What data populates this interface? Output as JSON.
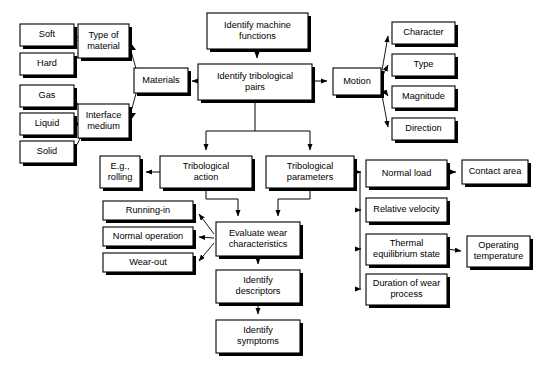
{
  "diagram": {
    "type": "flowchart",
    "background_color": "#ffffff",
    "box_fill_color": "#ffffff",
    "box_border_color": "#000000",
    "connector_color": "#000000",
    "nodes": [
      {
        "id": "soft",
        "label": "Soft",
        "x": 20,
        "y": 24,
        "w": 54,
        "h": 22
      },
      {
        "id": "hard",
        "label": "Hard",
        "x": 20,
        "y": 53,
        "w": 54,
        "h": 22
      },
      {
        "id": "gas",
        "label": "Gas",
        "x": 20,
        "y": 85,
        "w": 54,
        "h": 22
      },
      {
        "id": "liquid",
        "label": "Liquid",
        "x": 20,
        "y": 113,
        "w": 54,
        "h": 22
      },
      {
        "id": "solid",
        "label": "Solid",
        "x": 20,
        "y": 141,
        "w": 54,
        "h": 22
      },
      {
        "id": "type_material",
        "label": "Type of\nmaterial",
        "x": 78,
        "y": 24,
        "w": 51,
        "h": 34
      },
      {
        "id": "interface_med",
        "label": "Interface\nmedium",
        "x": 78,
        "y": 104,
        "w": 51,
        "h": 34
      },
      {
        "id": "materials",
        "label": "Materials",
        "x": 134,
        "y": 68,
        "w": 54,
        "h": 25
      },
      {
        "id": "machine_fn",
        "label": "Identify machine\nfunctions",
        "x": 207,
        "y": 13,
        "w": 101,
        "h": 36
      },
      {
        "id": "trib_pairs",
        "label": "Identify tribological\npairs",
        "x": 198,
        "y": 64,
        "w": 114,
        "h": 36
      },
      {
        "id": "motion",
        "label": "Motion",
        "x": 333,
        "y": 68,
        "w": 48,
        "h": 27
      },
      {
        "id": "character",
        "label": "Character",
        "x": 392,
        "y": 22,
        "w": 63,
        "h": 22
      },
      {
        "id": "mtype",
        "label": "Type",
        "x": 392,
        "y": 54,
        "w": 63,
        "h": 22
      },
      {
        "id": "magnitude",
        "label": "Magnitude",
        "x": 392,
        "y": 86,
        "w": 63,
        "h": 22
      },
      {
        "id": "direction",
        "label": "Direction",
        "x": 392,
        "y": 118,
        "w": 63,
        "h": 22
      },
      {
        "id": "eg_rolling",
        "label": "E.g.,\nrolling",
        "x": 100,
        "y": 156,
        "w": 40,
        "h": 32
      },
      {
        "id": "trib_action",
        "label": "Tribological\naction",
        "x": 160,
        "y": 156,
        "w": 92,
        "h": 32
      },
      {
        "id": "trib_params",
        "label": "Tribological\nparameters",
        "x": 266,
        "y": 156,
        "w": 88,
        "h": 32
      },
      {
        "id": "running_in",
        "label": "Running-in",
        "x": 103,
        "y": 201,
        "w": 90,
        "h": 19
      },
      {
        "id": "normal_op",
        "label": "Normal operation",
        "x": 103,
        "y": 227,
        "w": 90,
        "h": 19
      },
      {
        "id": "wear_out",
        "label": "Wear-out",
        "x": 103,
        "y": 253,
        "w": 90,
        "h": 19
      },
      {
        "id": "eval_wear",
        "label": "Evaluate wear\ncharacteristics",
        "x": 216,
        "y": 222,
        "w": 84,
        "h": 34
      },
      {
        "id": "identify_desc",
        "label": "Identify\ndescriptors",
        "x": 216,
        "y": 270,
        "w": 84,
        "h": 33
      },
      {
        "id": "identify_sym",
        "label": "Identify\nsymptoms",
        "x": 216,
        "y": 320,
        "w": 84,
        "h": 33
      },
      {
        "id": "normal_load",
        "label": "Normal load",
        "x": 366,
        "y": 160,
        "w": 81,
        "h": 27
      },
      {
        "id": "rel_velocity",
        "label": "Relative velocity",
        "x": 366,
        "y": 198,
        "w": 81,
        "h": 24
      },
      {
        "id": "thermal_eq",
        "label": "Thermal\nequilibrium state",
        "x": 366,
        "y": 234,
        "w": 81,
        "h": 31
      },
      {
        "id": "duration_wear",
        "label": "Duration of wear\nprocess",
        "x": 366,
        "y": 274,
        "w": 81,
        "h": 31
      },
      {
        "id": "contact_area",
        "label": "Contact area",
        "x": 462,
        "y": 160,
        "w": 66,
        "h": 24
      },
      {
        "id": "operating_temp",
        "label": "Operating\ntemperature",
        "x": 467,
        "y": 236,
        "w": 63,
        "h": 31
      }
    ],
    "edges": [
      {
        "from": "soft",
        "to": "type_material"
      },
      {
        "from": "hard",
        "to": "type_material"
      },
      {
        "from": "gas",
        "to": "interface_med"
      },
      {
        "from": "liquid",
        "to": "interface_med"
      },
      {
        "from": "solid",
        "to": "interface_med"
      },
      {
        "from": "type_material",
        "to": "materials"
      },
      {
        "from": "interface_med",
        "to": "materials"
      },
      {
        "from": "trib_pairs",
        "to": "materials"
      },
      {
        "from": "machine_fn",
        "to": "trib_pairs"
      },
      {
        "from": "trib_pairs",
        "to": "motion"
      },
      {
        "from": "motion",
        "to": "character"
      },
      {
        "from": "motion",
        "to": "mtype"
      },
      {
        "from": "motion",
        "to": "magnitude"
      },
      {
        "from": "motion",
        "to": "direction"
      },
      {
        "from": "trib_pairs",
        "to": "trib_action"
      },
      {
        "from": "trib_pairs",
        "to": "trib_params"
      },
      {
        "from": "trib_action",
        "to": "eg_rolling"
      },
      {
        "from": "trib_action",
        "to": "eval_wear"
      },
      {
        "from": "trib_params",
        "to": "eval_wear"
      },
      {
        "from": "eval_wear",
        "to": "running_in"
      },
      {
        "from": "eval_wear",
        "to": "normal_op"
      },
      {
        "from": "eval_wear",
        "to": "wear_out"
      },
      {
        "from": "eval_wear",
        "to": "identify_desc"
      },
      {
        "from": "identify_desc",
        "to": "identify_sym"
      },
      {
        "from": "trib_params",
        "to": "normal_load"
      },
      {
        "from": "trib_params",
        "to": "rel_velocity"
      },
      {
        "from": "trib_params",
        "to": "thermal_eq"
      },
      {
        "from": "trib_params",
        "to": "duration_wear"
      },
      {
        "from": "normal_load",
        "to": "contact_area"
      },
      {
        "from": "thermal_eq",
        "to": "operating_temp"
      }
    ]
  }
}
